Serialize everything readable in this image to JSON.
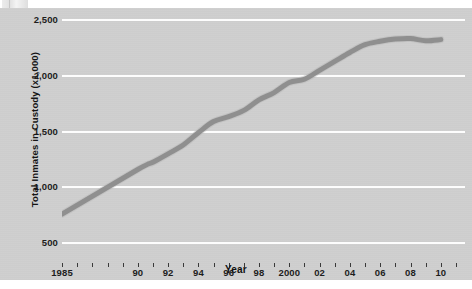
{
  "chart_data": {
    "type": "line",
    "title": "",
    "xlabel": "Year",
    "ylabel": "Total Inmates in Custody (x1,000)",
    "xlim": [
      1985,
      2011.6
    ],
    "ylim": [
      500,
      2500
    ],
    "grid": true,
    "legend": "none",
    "y_ticks": [
      500,
      1000,
      1500,
      2000,
      2500
    ],
    "y_tick_labels": [
      "500",
      "1,000",
      "1,500",
      "2,000",
      "2,500"
    ],
    "x_tick_years": [
      1985,
      1986,
      1987,
      1988,
      1989,
      1990,
      1991,
      1992,
      1993,
      1994,
      1995,
      1996,
      1997,
      1998,
      1999,
      2000,
      2001,
      2002,
      2003,
      2004,
      2005,
      2006,
      2007,
      2008,
      2009,
      2010,
      2011
    ],
    "x_tick_labels": [
      {
        "year": 1985,
        "label": "1985"
      },
      {
        "year": 1990,
        "label": "90"
      },
      {
        "year": 1992,
        "label": "92"
      },
      {
        "year": 1994,
        "label": "94"
      },
      {
        "year": 1996,
        "label": "96"
      },
      {
        "year": 1998,
        "label": "98"
      },
      {
        "year": 2000,
        "label": "2000"
      },
      {
        "year": 2002,
        "label": "02"
      },
      {
        "year": 2004,
        "label": "04"
      },
      {
        "year": 2006,
        "label": "06"
      },
      {
        "year": 2008,
        "label": "08"
      },
      {
        "year": 2010,
        "label": "10"
      }
    ],
    "x": [
      1985,
      1990,
      1991,
      1992,
      1993,
      1994,
      1995,
      1996,
      1997,
      1998,
      1999,
      2000,
      2001,
      2002,
      2003,
      2004,
      2005,
      2006,
      2007,
      2008,
      2009,
      2010
    ],
    "values": [
      750,
      1150,
      1215,
      1290,
      1370,
      1480,
      1580,
      1625,
      1680,
      1775,
      1840,
      1930,
      1960,
      2040,
      2120,
      2200,
      2270,
      2300,
      2320,
      2325,
      2305,
      2315
    ],
    "series": [
      {
        "name": "Total Inmates in Custody",
        "color": "#8c8c8c",
        "values": [
          750,
          1150,
          1215,
          1290,
          1370,
          1480,
          1580,
          1625,
          1680,
          1775,
          1840,
          1930,
          1960,
          2040,
          2120,
          2200,
          2270,
          2300,
          2320,
          2325,
          2305,
          2315
        ]
      }
    ],
    "colors": {
      "line": "#8c8c8c",
      "panel_background": "#cfcfcf",
      "gridline": "#fdfdfd",
      "text": "#1d1d1d",
      "page_background": "#ffffff"
    }
  }
}
